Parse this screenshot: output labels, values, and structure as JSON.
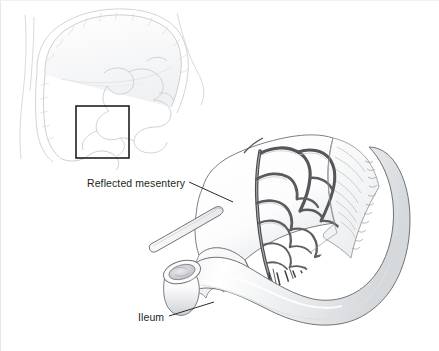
{
  "figure": {
    "domain": "medical-illustration",
    "background_color": "#ffffff",
    "line_color": "#231f20",
    "vessel_color": "#4a4a4a",
    "shade_color": "#d9dbdd"
  },
  "labels": [
    {
      "id": "reflected-mesentery",
      "text": "Reflected mesentery"
    },
    {
      "id": "ileum",
      "text": "Ileum"
    }
  ],
  "inset": {
    "name": "abdominal-overview-inset",
    "description": "Large intestine (colon) frame with small bowel loops and body wall outline",
    "roi_box": {
      "x": 75,
      "y": 105,
      "width": 53,
      "height": 52,
      "stroke": "#231f20"
    }
  },
  "main_illustration": {
    "name": "ileum-mesentery-detail",
    "parts": [
      {
        "id": "ileum-loop",
        "label": "Ileum"
      },
      {
        "id": "reflected-mesentery-sheet",
        "label": "Reflected mesentery"
      },
      {
        "id": "vascular-arcades",
        "label": "Mesenteric arcades"
      },
      {
        "id": "vasa-recta",
        "label": "Vasa recta"
      },
      {
        "id": "cut-end-lumen",
        "label": "Cut end of ileum"
      },
      {
        "id": "surgical-probe",
        "label": "Instrument"
      }
    ]
  },
  "leaders": [
    {
      "id": "leader-mesentery",
      "from": [
        188,
        181
      ],
      "to": [
        232,
        201
      ]
    },
    {
      "id": "leader-ileum",
      "from": [
        168,
        315
      ],
      "to": [
        213,
        301
      ]
    }
  ]
}
